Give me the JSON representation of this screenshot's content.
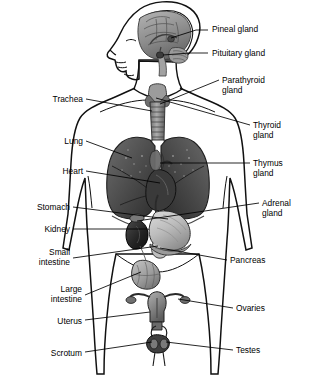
{
  "figure": {
    "background_color": "#ffffff",
    "ink_color": "#000000",
    "width": 315,
    "height": 378,
    "style": "grayscale anatomical illustration, front-view torso with left-facing head profile"
  },
  "labels_right": [
    {
      "id": "pineal-gland",
      "text": "Pineal gland",
      "text_x": 212,
      "text_y": 31,
      "line": "M 196,29 L 208,29",
      "target": [
        171,
        38
      ]
    },
    {
      "id": "pituitary-gland",
      "text": "Pituitary gland",
      "text_x": 212,
      "text_y": 55,
      "line": "M 190,53 L 208,53",
      "target": [
        163,
        55
      ]
    },
    {
      "id": "parathyroid-gland",
      "text": "Parathyroid",
      "text_x": 222,
      "text_y": 82,
      "line": "M 197,93 L 219,80",
      "target": [
        160,
        105
      ]
    },
    {
      "id": "parathyroid-gland-2",
      "text": "gland",
      "text_x": 222,
      "text_y": 92
    },
    {
      "id": "thyroid-gland",
      "text": "Thyroid",
      "text_x": 253,
      "text_y": 127,
      "line": "M 194,112 L 250,125",
      "target": [
        157,
        97
      ]
    },
    {
      "id": "thyroid-gland-2",
      "text": "gland",
      "text_x": 253,
      "text_y": 137
    },
    {
      "id": "thymus-gland",
      "text": "Thymus",
      "text_x": 253,
      "text_y": 165,
      "line": "M 206,163 L 250,163",
      "target": [
        162,
        163
      ]
    },
    {
      "id": "thymus-gland-2",
      "text": "gland",
      "text_x": 253,
      "text_y": 175
    },
    {
      "id": "adrenal-gland",
      "text": "Adrenal",
      "text_x": 262,
      "text_y": 205,
      "line": "M 208,213 L 259,203",
      "target": [
        137,
        220
      ]
    },
    {
      "id": "adrenal-gland-2",
      "text": "gland",
      "text_x": 262,
      "text_y": 215
    },
    {
      "id": "pancreas",
      "text": "Pancreas",
      "text_x": 230,
      "text_y": 262,
      "line": "M 196,258 L 227,260",
      "target": [
        160,
        247
      ]
    },
    {
      "id": "ovaries",
      "text": "Ovaries",
      "text_x": 236,
      "text_y": 310,
      "line": "M 188,303 L 233,308",
      "target": [
        177,
        297
      ]
    },
    {
      "id": "testes",
      "text": "Testes",
      "text_x": 236,
      "text_y": 352,
      "line": "M 178,345 L 233,350",
      "target": [
        168,
        341
      ]
    }
  ],
  "labels_left": [
    {
      "id": "trachea",
      "text": "Trachea",
      "text_x": 83,
      "text_y": 102,
      "line": "M 86,99 L 104,99",
      "target": [
        152,
        110
      ]
    },
    {
      "id": "lung",
      "text": "Lung",
      "text_x": 83,
      "text_y": 144,
      "line": "M 86,141 L 100,141",
      "target": [
        132,
        157
      ]
    },
    {
      "id": "heart",
      "text": "Heart",
      "text_x": 83,
      "text_y": 174,
      "line": "M 86,171 L 103,171",
      "target": [
        159,
        182
      ]
    },
    {
      "id": "stomach",
      "text": "Stomach",
      "text_x": 70,
      "text_y": 210,
      "line": "M 73,207 L 92,207",
      "target": [
        165,
        218
      ]
    },
    {
      "id": "kidney",
      "text": "Kidney",
      "text_x": 70,
      "text_y": 232,
      "line": "M 73,229 L 90,229",
      "target": [
        136,
        229
      ]
    },
    {
      "id": "small-intestine",
      "text": "Small",
      "text_x": 70,
      "text_y": 254,
      "line": "M 73,258 L 92,258",
      "target": [
        157,
        246
      ]
    },
    {
      "id": "small-intestine-2",
      "text": "intestine",
      "text_x": 70,
      "text_y": 264
    },
    {
      "id": "large-intestine",
      "text": "Large",
      "text_x": 82,
      "text_y": 291,
      "line": "M 85,295 L 108,288",
      "target": [
        140,
        272
      ]
    },
    {
      "id": "large-intestine-2",
      "text": "intestine",
      "text_x": 82,
      "text_y": 301
    },
    {
      "id": "uterus",
      "text": "Uterus",
      "text_x": 82,
      "text_y": 323,
      "line": "M 85,320 L 104,320",
      "target": [
        148,
        311
      ]
    },
    {
      "id": "scrotum",
      "text": "Scrotum",
      "text_x": 82,
      "text_y": 355,
      "line": "M 85,352 L 112,352",
      "target": [
        151,
        342
      ]
    }
  ],
  "organs": [
    {
      "id": "brain",
      "label": "brain sagittal section",
      "shade": "#8c8c8c"
    },
    {
      "id": "pineal",
      "label": "pineal gland",
      "shade": "#555555"
    },
    {
      "id": "pituitary",
      "label": "pituitary gland",
      "shade": "#4a4a4a"
    },
    {
      "id": "thyroid",
      "label": "thyroid gland",
      "shade": "#707070"
    },
    {
      "id": "trachea",
      "label": "trachea",
      "shade": "#8f8f8f"
    },
    {
      "id": "lung-left",
      "label": "left lung",
      "shade": "#4b4b4b"
    },
    {
      "id": "lung-right",
      "label": "right lung",
      "shade": "#464646"
    },
    {
      "id": "heart",
      "label": "heart",
      "shade": "#3a3a3a"
    },
    {
      "id": "thymus",
      "label": "thymus gland",
      "shade": "#6b6b6b"
    },
    {
      "id": "stomach",
      "label": "stomach",
      "shade": "#b8b8b8"
    },
    {
      "id": "kidney",
      "label": "kidney",
      "shade": "#2b2b2b"
    },
    {
      "id": "adrenal",
      "label": "adrenal gland",
      "shade": "#777777"
    },
    {
      "id": "pancreas",
      "label": "pancreas",
      "shade": "#9a9a9a"
    },
    {
      "id": "large-intestine",
      "label": "large intestine",
      "shade": "#a5a5a5"
    },
    {
      "id": "uterus",
      "label": "uterus",
      "shade": "#8a8a8a"
    },
    {
      "id": "ovary-left",
      "label": "left ovary",
      "shade": "#707070"
    },
    {
      "id": "ovary-right",
      "label": "right ovary",
      "shade": "#707070"
    },
    {
      "id": "scrotum",
      "label": "scrotum and testes",
      "shade": "#3f3f3f"
    }
  ]
}
